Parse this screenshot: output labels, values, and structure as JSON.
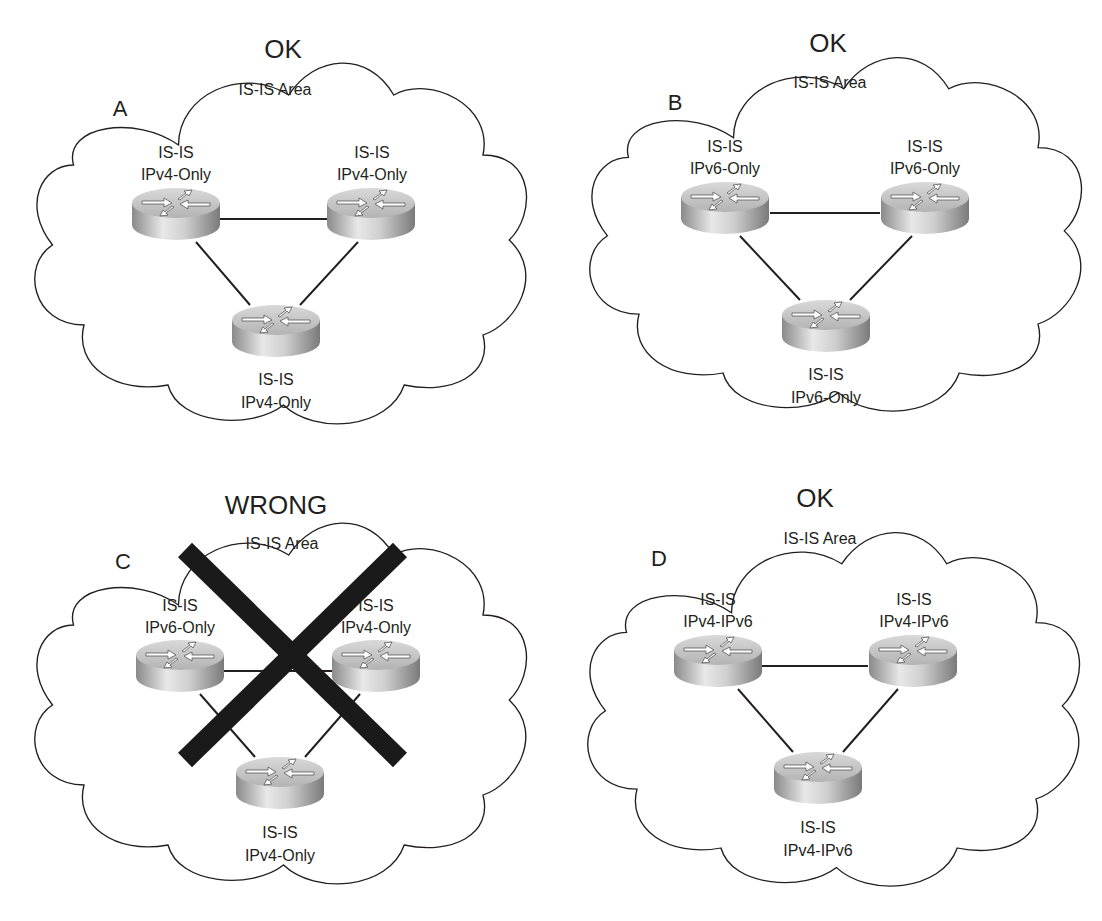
{
  "panels": [
    {
      "id": "A",
      "letter": "A",
      "status": "OK",
      "area_label": "IS-IS Area",
      "routers": [
        {
          "position": "top-left",
          "line1": "IS-IS",
          "line2": "IPv4-Only"
        },
        {
          "position": "top-right",
          "line1": "IS-IS",
          "line2": "IPv4-Only"
        },
        {
          "position": "bottom",
          "line1": "IS-IS",
          "line2": "IPv4-Only"
        }
      ],
      "crossed_out": false
    },
    {
      "id": "B",
      "letter": "B",
      "status": "OK",
      "area_label": "IS-IS Area",
      "routers": [
        {
          "position": "top-left",
          "line1": "IS-IS",
          "line2": "IPv6-Only"
        },
        {
          "position": "top-right",
          "line1": "IS-IS",
          "line2": "IPv6-Only"
        },
        {
          "position": "bottom",
          "line1": "IS-IS",
          "line2": "IPv6-Only"
        }
      ],
      "crossed_out": false
    },
    {
      "id": "C",
      "letter": "C",
      "status": "WRONG",
      "area_label": "IS-IS Area",
      "routers": [
        {
          "position": "top-left",
          "line1": "IS-IS",
          "line2": "IPv6-Only"
        },
        {
          "position": "top-right",
          "line1": "IS-IS",
          "line2": "IPv4-Only"
        },
        {
          "position": "bottom",
          "line1": "IS-IS",
          "line2": "IPv4-Only"
        }
      ],
      "crossed_out": true
    },
    {
      "id": "D",
      "letter": "D",
      "status": "OK",
      "area_label": "IS-IS Area",
      "routers": [
        {
          "position": "top-left",
          "line1": "IS-IS",
          "line2": "IPv4-IPv6"
        },
        {
          "position": "top-right",
          "line1": "IS-IS",
          "line2": "IPv4-IPv6"
        },
        {
          "position": "bottom",
          "line1": "IS-IS",
          "line2": "IPv4-IPv6"
        }
      ],
      "crossed_out": false
    }
  ],
  "colors": {
    "stroke": "#231f20",
    "router_light": "#e6e6e6",
    "router_dark": "#8c8c8c",
    "cross": "#1a1a1a"
  }
}
